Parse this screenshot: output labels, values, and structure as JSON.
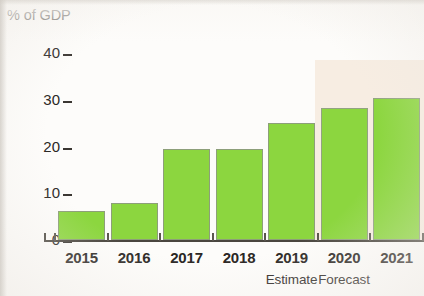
{
  "chart_data": {
    "type": "bar",
    "title": "% of GDP",
    "xlabel": "",
    "ylabel": "% of GDP",
    "categories": [
      "2015",
      "2016",
      "2017",
      "2018",
      "2019",
      "2020",
      "2021"
    ],
    "values": [
      6.2,
      8.0,
      19.5,
      19.5,
      25.0,
      28.3,
      30.5
    ],
    "series": [
      {
        "name": "% of GDP",
        "values": [
          6.2,
          8.0,
          19.5,
          19.5,
          25.0,
          28.3,
          30.5
        ]
      }
    ],
    "ylim": [
      0,
      40
    ],
    "ytick_values": [
      0,
      10,
      20,
      30,
      40
    ],
    "ytick_labels": [
      "0",
      "10",
      "20",
      "30",
      "40"
    ],
    "grid": false,
    "legend": false,
    "bar_color": "#8cd63f",
    "bar_border_color": "#8d9f79",
    "background_color": "#fdfcfa",
    "annotations": [
      {
        "text": "Estimate",
        "for_category": "2019"
      },
      {
        "text": "Forecast",
        "for_category": "2020"
      }
    ],
    "shaded_region": {
      "label": "forecast",
      "from_category": "2020",
      "to_category": "2021",
      "color": "#f6ece0"
    }
  },
  "axis": {
    "y_ticks": [
      {
        "label": "40",
        "value": 40
      },
      {
        "label": "30",
        "value": 30
      },
      {
        "label": "20",
        "value": 20
      },
      {
        "label": "10",
        "value": 10
      },
      {
        "label": "0",
        "value": 0
      }
    ]
  },
  "bars": [
    {
      "category": "2015",
      "value": 6.2,
      "shaded": false
    },
    {
      "category": "2016",
      "value": 8.0,
      "shaded": false
    },
    {
      "category": "2017",
      "value": 19.5,
      "shaded": false
    },
    {
      "category": "2018",
      "value": 19.5,
      "shaded": false
    },
    {
      "category": "2019",
      "value": 25.0,
      "shaded": false
    },
    {
      "category": "2020",
      "value": 28.3,
      "shaded": true
    },
    {
      "category": "2021",
      "value": 30.5,
      "shaded": true
    }
  ],
  "sublabels": [
    {
      "text": "Estimate",
      "category": "2019"
    },
    {
      "text": "Forecast",
      "category": "2020"
    }
  ]
}
